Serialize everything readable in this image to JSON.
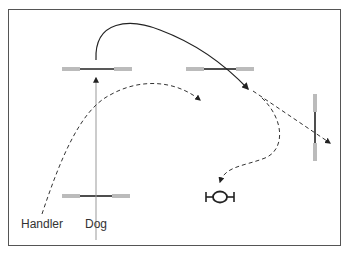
{
  "diagram": {
    "type": "agility course sequence",
    "labels": {
      "handler": "Handler",
      "dog": "Dog"
    },
    "obstacles": [
      {
        "id": "jump-start",
        "kind": "bar-jump",
        "orientation": "horizontal",
        "x1": 62,
        "x2": 130,
        "y": 69
      },
      {
        "id": "jump-top-right",
        "kind": "bar-jump",
        "orientation": "horizontal",
        "x1": 187,
        "x2": 254,
        "y": 69
      },
      {
        "id": "jump-right-vertical",
        "kind": "bar-jump",
        "orientation": "vertical",
        "x": 315,
        "y1": 120,
        "y2": 183
      },
      {
        "id": "jump-bottom",
        "kind": "bar-jump",
        "orientation": "horizontal",
        "x1": 62,
        "x2": 130,
        "y": 195
      },
      {
        "id": "tire",
        "kind": "tire-or-table",
        "x": 220,
        "y": 197
      }
    ],
    "paths": [
      {
        "id": "dog-approach",
        "style": "solid-thin",
        "color": "#999999"
      },
      {
        "id": "dog-jump-path",
        "style": "solid",
        "color": "#222222"
      },
      {
        "id": "handler-path",
        "style": "dashed",
        "color": "#333333"
      },
      {
        "id": "dog-continue-path",
        "style": "dashed",
        "color": "#333333"
      },
      {
        "id": "dog-return-path",
        "style": "dashed",
        "color": "#333333"
      }
    ],
    "colors": {
      "frame": "#555555",
      "bar": "#222222",
      "wing": "#bbbbbb",
      "path": "#333333",
      "guide": "#999999"
    }
  }
}
